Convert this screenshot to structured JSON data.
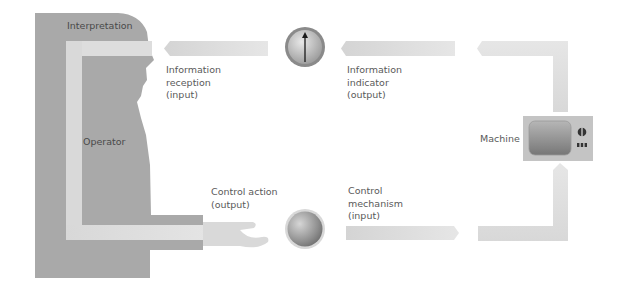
{
  "diagram": {
    "operator": {
      "interpretation_label": "Interpretation",
      "operator_label": "Operator"
    },
    "labels": {
      "info_reception": [
        "Information",
        "reception",
        "(input)"
      ],
      "info_indicator": [
        "Information",
        "indicator",
        "(output)"
      ],
      "control_action": [
        "Control action",
        "(output)"
      ],
      "control_mechanism": [
        "Control",
        "mechanism",
        "(input)"
      ],
      "machine": "Machine"
    },
    "icons": {
      "indicator": "gauge-dial-icon",
      "control": "knob-control-icon",
      "machine": "television-monitor-icon"
    },
    "colors": {
      "silhouette": "#a9a9a9",
      "inner_path": "#dcdcdc",
      "arrow": "#dddddd",
      "text": "#5a5a5a",
      "tv_body": "#c4c4c4",
      "tv_screen": "#8f8f8f"
    }
  }
}
